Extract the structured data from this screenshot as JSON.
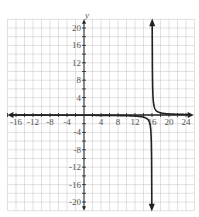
{
  "chart_data": {
    "type": "line",
    "title": "",
    "xlabel": "",
    "ylabel": "y",
    "xlim": [
      -16,
      25
    ],
    "ylim": [
      -21,
      21
    ],
    "grid": true,
    "grid_step": 2,
    "x_ticks": [
      -16,
      -12,
      -8,
      -4,
      4,
      8,
      12,
      16,
      20,
      24
    ],
    "x_tick_labels": [
      "-16",
      "-12",
      "-8",
      "-4",
      "4",
      "8",
      "12",
      "16",
      "20",
      "24"
    ],
    "y_ticks": [
      -20,
      -16,
      -12,
      -8,
      -4,
      4,
      8,
      12,
      16,
      20
    ],
    "y_tick_labels": [
      "-20",
      "-16",
      "-12",
      "-8",
      "-4",
      "4",
      "8",
      "12",
      "16",
      "20"
    ],
    "vertical_asymptote": 16,
    "horizontal_asymptote": 0,
    "function": "y = 1/(x - 16)",
    "series": [
      {
        "name": "left branch",
        "x": [
          -16,
          -8,
          0,
          8,
          12,
          14,
          15,
          15.5,
          15.8,
          15.95
        ],
        "y": [
          -0.03,
          -0.04,
          -0.06,
          -0.13,
          -0.25,
          -0.5,
          -1,
          -2,
          -5,
          -20
        ]
      },
      {
        "name": "right branch",
        "x": [
          16.05,
          16.2,
          16.5,
          17,
          18,
          20,
          24
        ],
        "y": [
          20,
          5,
          2,
          1,
          0.5,
          0.25,
          0.13
        ]
      }
    ],
    "colors": {
      "curve": "#222222",
      "axes": "#222222",
      "grid": "#cccccc",
      "labels": "#555555"
    }
  }
}
